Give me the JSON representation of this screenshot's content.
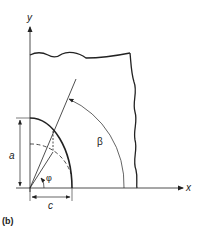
{
  "figure": {
    "panel_label": "(b)",
    "axes": {
      "x_label": "x",
      "y_label": "y"
    },
    "dimensions": {
      "a_label": "a",
      "c_label": "c"
    },
    "angles": {
      "phi_label": "φ",
      "beta_label": "β"
    },
    "colors": {
      "line": "#222222",
      "background": "#ffffff"
    }
  }
}
